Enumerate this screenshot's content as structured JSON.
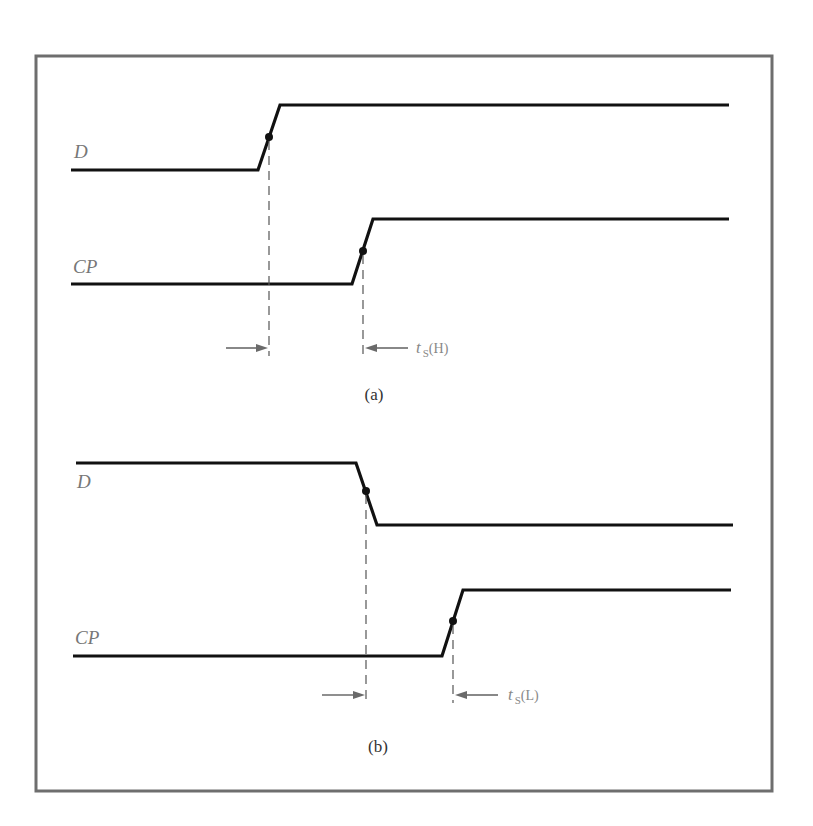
{
  "figure": {
    "frame": {
      "x": 36,
      "y": 56,
      "width": 736,
      "height": 735,
      "color": "#6e6e6e"
    },
    "colors": {
      "waveform": "#111111",
      "dash": "#555555",
      "arrow": "#6a6a6a",
      "label": "#777777"
    }
  },
  "panels": [
    {
      "caption": "(a)",
      "signals": [
        {
          "label": "D",
          "transition": "rising",
          "low_y": 170,
          "high_y": 105,
          "start_x": 71,
          "edge_start_x": 258,
          "edge_end_x": 280,
          "end_x": 729,
          "dot": [
            269,
            137
          ]
        },
        {
          "label": "CP",
          "transition": "rising",
          "low_y": 284,
          "high_y": 219,
          "start_x": 71,
          "edge_start_x": 352,
          "edge_end_x": 373,
          "end_x": 729,
          "dot": [
            363,
            251
          ]
        }
      ],
      "timing": {
        "name": "t",
        "subscript": "S",
        "suffix": "(H)",
        "from_x": 269,
        "to_x": 363,
        "arrow_y": 348
      }
    },
    {
      "caption": "(b)",
      "signals": [
        {
          "label": "D",
          "transition": "falling",
          "low_y": 525,
          "high_y": 463,
          "start_x": 76,
          "edge_start_x": 356,
          "edge_end_x": 377,
          "end_x": 733,
          "dot": [
            366,
            491
          ]
        },
        {
          "label": "CP",
          "transition": "rising",
          "low_y": 656,
          "high_y": 590,
          "start_x": 73,
          "edge_start_x": 442,
          "edge_end_x": 463,
          "end_x": 731,
          "dot": [
            453,
            621
          ]
        }
      ],
      "timing": {
        "name": "t",
        "subscript": "S",
        "suffix": "(L)",
        "from_x": 366,
        "to_x": 453,
        "arrow_y": 695
      }
    }
  ]
}
